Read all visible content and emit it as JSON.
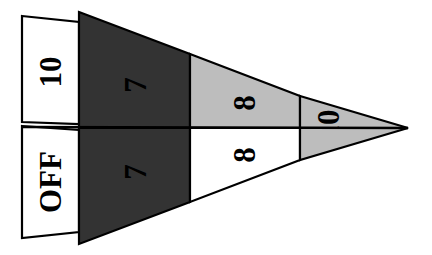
{
  "figure": {
    "background_color": "#ffffff",
    "outline_color": "#000000",
    "apex": {
      "x": 408,
      "y": 128
    },
    "colors": {
      "white": "#ffffff",
      "gray": "#bdbdbd",
      "dark": "#333333",
      "outline": "#000000",
      "label": "#000000"
    },
    "label_rotation_deg": -90,
    "rows": [
      {
        "name": "upper-row",
        "segments": [
          {
            "name": "upper-segment-1",
            "label": "10",
            "fill": "#ffffff"
          },
          {
            "name": "upper-segment-2",
            "label": "7",
            "fill": "#333333"
          },
          {
            "name": "upper-segment-3",
            "label": "8",
            "fill": "#bdbdbd"
          },
          {
            "name": "upper-segment-4",
            "label": "10",
            "fill": "#bdbdbd"
          }
        ]
      },
      {
        "name": "lower-row",
        "segments": [
          {
            "name": "lower-segment-1",
            "label": "OFF",
            "fill": "#ffffff"
          },
          {
            "name": "lower-segment-2",
            "label": "7",
            "fill": "#333333"
          },
          {
            "name": "lower-segment-3",
            "label": "8",
            "fill": "#ffffff"
          },
          {
            "name": "lower-segment-4",
            "label": "",
            "fill": "#bdbdbd"
          }
        ]
      }
    ]
  }
}
